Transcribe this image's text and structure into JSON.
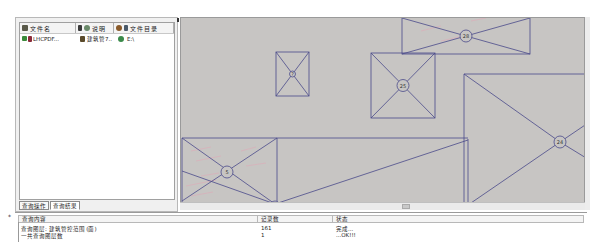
{
  "left_panel": {
    "columns": [
      {
        "icon": "layer-icon",
        "label": "文件名"
      },
      {
        "icon": "pin-icon",
        "label": "说明"
      },
      {
        "icon": "folder-icon",
        "label": "文件目录"
      }
    ],
    "rows": [
      {
        "checked": true,
        "file_name": "LHCPDF...",
        "description": "建筑管7..",
        "directory": "E:\\"
      }
    ],
    "bottom_tabs": [
      {
        "label": "查询操作",
        "active": false
      },
      {
        "label": "查询结果",
        "active": true
      }
    ]
  },
  "map": {
    "background": "#c7c5c3",
    "line_color": "#4a4a8a",
    "features": [
      {
        "id": "feature-small",
        "label": "?"
      },
      {
        "id": "feature-25",
        "label": "25"
      },
      {
        "id": "feature-28",
        "label": "28"
      },
      {
        "id": "feature-24",
        "label": "24"
      },
      {
        "id": "feature-5",
        "label": "5"
      }
    ]
  },
  "results": {
    "columns": [
      "查询内容",
      "记录数",
      "状态"
    ],
    "rows": [
      {
        "content": "查询图层: 建筑管控范围 (面)",
        "count": "161",
        "status": "完成..."
      },
      {
        "content": "一共查询图层数",
        "count": "1",
        "status": "...OK!!!"
      }
    ]
  }
}
